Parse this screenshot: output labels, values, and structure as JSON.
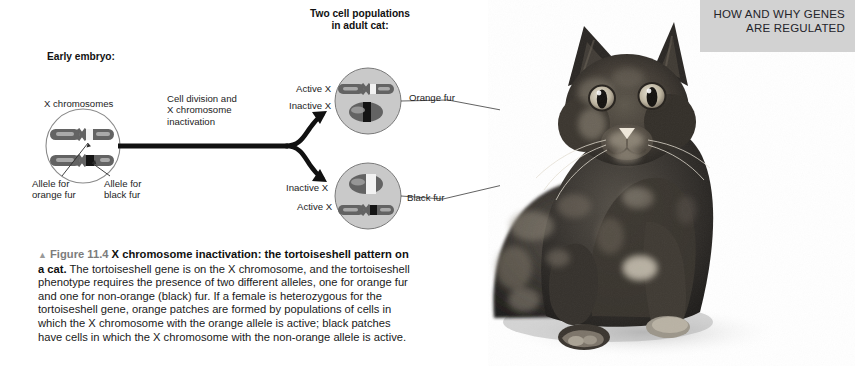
{
  "header": {
    "banner_text": "HOW AND WHY GENES\nARE REGULATED",
    "banner_bg": "#d2d2d2"
  },
  "diagram": {
    "early_embryo_label": "Early embryo:",
    "two_cell_populations_label": "Two cell populations\nin adult cat:",
    "x_chromosomes_label": "X chromosomes",
    "allele_orange_label": "Allele for\norange fur",
    "allele_black_label": "Allele for\nblack fur",
    "process_label": "Cell division and\nX chromosome\ninactivation",
    "top_cell": {
      "active_x_label": "Active X",
      "inactive_x_label": "Inactive X",
      "fur_label": "Orange fur"
    },
    "bottom_cell": {
      "inactive_x_label": "Inactive X",
      "active_x_label": "Active X",
      "fur_label": "Black fur"
    },
    "colors": {
      "cell_fill": "#c9c9c9",
      "cell_stroke": "#6e6e6e",
      "chromosome_body": "#636363",
      "chromosome_band_light": "#b4b4b4",
      "allele_orange_band": "#f2f2f2",
      "allele_black_band": "#151515",
      "arrow": "#111111",
      "leader_line": "#3a3a3a"
    }
  },
  "caption": {
    "triangle": "▲",
    "figure_number": "Figure 11.4",
    "title": "X chromosome inactivation: the tortoiseshell pattern on a cat.",
    "body": "The tortoiseshell gene is on the X chromosome, and the tortoiseshell phenotype requires the presence of two different alleles, one for orange fur and one for non-orange (black) fur. If a female is heterozygous for the tortoiseshell gene, orange patches are formed by populations of cells in which the X chromosome with the orange allele is active; black patches have cells in which the X chromosome with the non-orange allele is active."
  },
  "photo": {
    "alt_name": "tortoiseshell-cat-photograph"
  }
}
